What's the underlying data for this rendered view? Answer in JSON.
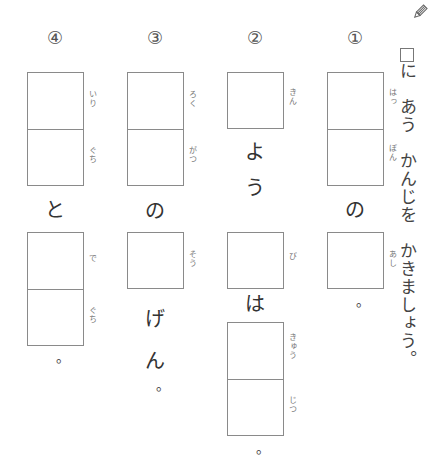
{
  "instruction": {
    "icon": "pencil-icon",
    "text_after_box": "に　あう　かんじを　かきましょう。"
  },
  "questions": [
    {
      "number": "①",
      "items": [
        {
          "type": "box_double",
          "furigana": [
            "はっ",
            "ぽん"
          ]
        },
        {
          "type": "kana",
          "text": "の"
        },
        {
          "type": "box_single",
          "furigana": [
            "あし"
          ]
        },
        {
          "type": "kana",
          "text": "。"
        }
      ]
    },
    {
      "number": "②",
      "items": [
        {
          "type": "box_single",
          "furigana": [
            "きん"
          ]
        },
        {
          "type": "kana",
          "text": "よ"
        },
        {
          "type": "kana",
          "text": "う"
        },
        {
          "type": "box_single",
          "furigana": [
            "び"
          ]
        },
        {
          "type": "kana",
          "text": "は"
        },
        {
          "type": "box_double",
          "furigana": [
            "きゅう",
            "じつ"
          ]
        },
        {
          "type": "kana",
          "text": "。"
        }
      ]
    },
    {
      "number": "③",
      "items": [
        {
          "type": "box_double",
          "furigana": [
            "ろく",
            "がつ"
          ]
        },
        {
          "type": "kana",
          "text": "の"
        },
        {
          "type": "box_single",
          "furigana": [
            "そう"
          ]
        },
        {
          "type": "kana",
          "text": "げ"
        },
        {
          "type": "kana",
          "text": "ん"
        },
        {
          "type": "kana",
          "text": "。"
        }
      ]
    },
    {
      "number": "④",
      "items": [
        {
          "type": "box_double",
          "furigana": [
            "いり",
            "ぐち"
          ]
        },
        {
          "type": "kana",
          "text": "と"
        },
        {
          "type": "box_double",
          "furigana": [
            "で",
            "ぐち"
          ]
        },
        {
          "type": "kana",
          "text": "。"
        }
      ]
    }
  ]
}
